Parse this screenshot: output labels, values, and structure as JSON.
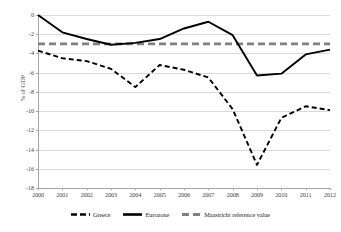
{
  "chart_data": {
    "type": "line",
    "title": "",
    "xlabel": "",
    "ylabel": "% of GDP",
    "x": [
      2000,
      2001,
      2002,
      2003,
      2004,
      2005,
      2006,
      2007,
      2008,
      2009,
      2010,
      2011,
      2012
    ],
    "categories": [
      "2000",
      "2001",
      "2002",
      "2003",
      "2004",
      "2005",
      "2006",
      "2007",
      "2008",
      "2009",
      "2010",
      "2011",
      "2012"
    ],
    "xlim": [
      2000,
      2012
    ],
    "ylim": [
      -18,
      0
    ],
    "yticks": [
      0,
      -2,
      -4,
      -6,
      -8,
      -10,
      -12,
      -14,
      -16,
      -18
    ],
    "ytick_labels": [
      "0",
      "-2",
      "-4",
      "-6",
      "-8",
      "-10",
      "-12",
      "-14",
      "-16",
      "-18"
    ],
    "grid": "horizontal",
    "legend_position": "bottom",
    "series": [
      {
        "name": "Greece",
        "style": "dashed",
        "color": "#000000",
        "values": [
          -3.7,
          -4.5,
          -4.8,
          -5.6,
          -7.5,
          -5.2,
          -5.7,
          -6.5,
          -9.8,
          -15.6,
          -10.7,
          -9.5,
          -9.9
        ]
      },
      {
        "name": "Eurozone",
        "style": "solid",
        "color": "#000000",
        "values": [
          0.0,
          -1.8,
          -2.5,
          -3.1,
          -2.9,
          -2.5,
          -1.4,
          -0.7,
          -2.1,
          -6.3,
          -6.1,
          -4.1,
          -3.6
        ]
      },
      {
        "name": "Maastricht reference value",
        "style": "dashed-thick",
        "color": "#808080",
        "constant": -3,
        "values": [
          -3,
          -3,
          -3,
          -3,
          -3,
          -3,
          -3,
          -3,
          -3,
          -3,
          -3,
          -3,
          -3
        ]
      }
    ]
  },
  "axis": {
    "y_title": "% of GDP"
  },
  "legend": {
    "items": [
      {
        "label": "Greece"
      },
      {
        "label": "Eurozone"
      },
      {
        "label": "Maastricht reference value"
      }
    ]
  }
}
